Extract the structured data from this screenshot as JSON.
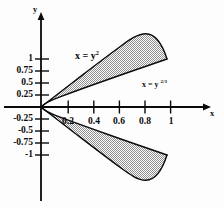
{
  "chart_data": {
    "type": "area",
    "title": "",
    "subtitle": "",
    "xlabel": "x",
    "ylabel": "y",
    "xlim": [
      -0.12,
      1.28
    ],
    "ylim": [
      -1.45,
      1.45
    ],
    "grid": false,
    "legend_position": "inline-annotations",
    "xticks": [
      0.2,
      0.4,
      0.6,
      0.8,
      1
    ],
    "xtick_labels": [
      "0.2",
      "0.4",
      "0.6",
      "0.8",
      "1"
    ],
    "yticks": [
      1,
      0.75,
      0.5,
      0.25,
      -0.25,
      -0.5,
      -0.75,
      -1
    ],
    "ytick_labels": [
      "1",
      "0.75",
      "0.5",
      "0.25",
      "-0.25",
      "-0.5",
      "-0.75",
      "-1"
    ],
    "annotations": [
      {
        "text_html": "x = y<sup>2</sup>",
        "plain": "x = y^2",
        "x": 0.33,
        "y": 1.12
      },
      {
        "text_html": "x = y <sup>2/3</sup>",
        "plain": "x = y^(2/3)",
        "x": 0.86,
        "y": 0.42
      }
    ],
    "series": [
      {
        "name": "x = y^2",
        "equation": "x = y^2",
        "curve_kind": "parabola-right-opening",
        "points": [
          {
            "x": 0,
            "y": 0
          },
          {
            "x": 0.0025,
            "y": 0.05
          },
          {
            "x": 0.01,
            "y": 0.1
          },
          {
            "x": 0.0225,
            "y": 0.15
          },
          {
            "x": 0.04,
            "y": 0.2
          },
          {
            "x": 0.0625,
            "y": 0.25
          },
          {
            "x": 0.09,
            "y": 0.3
          },
          {
            "x": 0.1225,
            "y": 0.35
          },
          {
            "x": 0.16,
            "y": 0.4
          },
          {
            "x": 0.2025,
            "y": 0.45
          },
          {
            "x": 0.25,
            "y": 0.5
          },
          {
            "x": 0.3025,
            "y": 0.55
          },
          {
            "x": 0.36,
            "y": 0.6
          },
          {
            "x": 0.4225,
            "y": 0.65
          },
          {
            "x": 0.49,
            "y": 0.7
          },
          {
            "x": 0.5625,
            "y": 0.75
          },
          {
            "x": 0.64,
            "y": 0.8
          },
          {
            "x": 0.7225,
            "y": 0.85
          },
          {
            "x": 0.81,
            "y": 0.9
          },
          {
            "x": 0.9025,
            "y": 0.95
          },
          {
            "x": 1,
            "y": 1
          }
        ]
      },
      {
        "name": "x = y^(2/3)",
        "equation": "x = y^(2/3)",
        "curve_kind": "cusped-right-opening",
        "points": [
          {
            "x": 0,
            "y": 0
          },
          {
            "x": 0.1357,
            "y": 0.05
          },
          {
            "x": 0.2154,
            "y": 0.1
          },
          {
            "x": 0.2823,
            "y": 0.15
          },
          {
            "x": 0.342,
            "y": 0.2
          },
          {
            "x": 0.3969,
            "y": 0.25
          },
          {
            "x": 0.4481,
            "y": 0.3
          },
          {
            "x": 0.4966,
            "y": 0.35
          },
          {
            "x": 0.5429,
            "y": 0.4
          },
          {
            "x": 0.5873,
            "y": 0.45
          },
          {
            "x": 0.63,
            "y": 0.5
          },
          {
            "x": 0.6713,
            "y": 0.55
          },
          {
            "x": 0.7114,
            "y": 0.6
          },
          {
            "x": 0.7503,
            "y": 0.65
          },
          {
            "x": 0.7883,
            "y": 0.7
          },
          {
            "x": 0.8255,
            "y": 0.75
          },
          {
            "x": 0.8618,
            "y": 0.8
          },
          {
            "x": 0.8973,
            "y": 0.85
          },
          {
            "x": 0.9322,
            "y": 0.9
          },
          {
            "x": 0.9664,
            "y": 0.95
          },
          {
            "x": 1,
            "y": 1
          }
        ]
      }
    ],
    "shaded_regions": [
      {
        "name": "upper-lens",
        "between": [
          "x = y^2",
          "x = y^(2/3)"
        ],
        "y_range": [
          0,
          1
        ],
        "fill": "#b4b4b4",
        "pattern": "checker-dither"
      },
      {
        "name": "lower-lens",
        "between": [
          "x = y^2",
          "x = y^(2/3)"
        ],
        "y_range": [
          -1,
          0
        ],
        "fill": "#b4b4b4",
        "pattern": "checker-dither"
      }
    ],
    "intersections": [
      {
        "x": 0,
        "y": 0
      },
      {
        "x": 1,
        "y": 1
      },
      {
        "x": 1,
        "y": -1
      }
    ],
    "colors": {
      "background": "#fdfdfd",
      "axis": "#0a0a0a",
      "curve": "#0a0a0a",
      "shading": "#b4b4b4",
      "text": "#0a0a0a"
    }
  }
}
